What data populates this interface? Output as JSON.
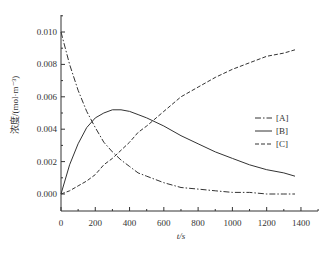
{
  "chart_data": {
    "type": "line",
    "title": "",
    "xlabel": "t/s",
    "ylabel": "浓度/(mol·m⁻³)",
    "xlim": [
      0,
      1500
    ],
    "ylim": [
      -0.0008,
      0.011
    ],
    "xticks": [
      "0",
      "200",
      "400",
      "600",
      "800",
      "1000",
      "1200",
      "1400"
    ],
    "yticks": [
      "0.000",
      "0.002",
      "0.004",
      "0.006",
      "0.008",
      "0.010"
    ],
    "legend": {
      "position": "right-middle",
      "entries": [
        "[A]",
        "[B]",
        "[C]"
      ]
    },
    "grid": false,
    "x": [
      0,
      50,
      100,
      150,
      200,
      250,
      300,
      350,
      400,
      450,
      500,
      600,
      700,
      800,
      900,
      1000,
      1100,
      1200,
      1300,
      1365
    ],
    "series": [
      {
        "name": "[A]",
        "style": "dash-dot",
        "values": [
          0.01,
          0.008,
          0.0064,
          0.0051,
          0.0041,
          0.0032,
          0.0026,
          0.0021,
          0.0017,
          0.0013,
          0.0011,
          0.0007,
          0.0004,
          0.0003,
          0.0002,
          0.0001,
          0.0001,
          0.0,
          0.0,
          0.0
        ]
      },
      {
        "name": "[B]",
        "style": "solid",
        "values": [
          0.0,
          0.0018,
          0.0031,
          0.0041,
          0.0047,
          0.005,
          0.0052,
          0.0052,
          0.0051,
          0.0049,
          0.0047,
          0.0042,
          0.0036,
          0.0031,
          0.0026,
          0.0022,
          0.0018,
          0.0015,
          0.0013,
          0.0011
        ]
      },
      {
        "name": "[C]",
        "style": "dashed",
        "values": [
          0.0,
          0.0002,
          0.0005,
          0.0008,
          0.0012,
          0.0018,
          0.0022,
          0.0027,
          0.0032,
          0.0038,
          0.0042,
          0.0051,
          0.006,
          0.0066,
          0.0072,
          0.0077,
          0.0081,
          0.0085,
          0.0087,
          0.0089
        ]
      }
    ]
  }
}
